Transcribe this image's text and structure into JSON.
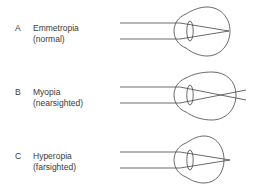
{
  "figure": {
    "panels": [
      {
        "letter": "A",
        "title": "Emmetropia",
        "subtitle": "(normal)",
        "focus": "on retina"
      },
      {
        "letter": "B",
        "title": "Myopia",
        "subtitle": "(nearsighted)",
        "focus": "in front of retina"
      },
      {
        "letter": "C",
        "title": "Hyperopia",
        "subtitle": "(farsighted)",
        "focus": "behind retina"
      }
    ],
    "colors": {
      "line": "#444444",
      "text": "#3a3a3a",
      "background": "#ffffff"
    }
  }
}
